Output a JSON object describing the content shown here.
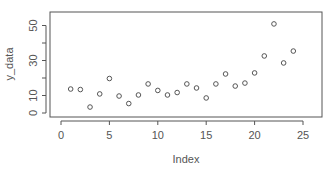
{
  "chart_data": {
    "type": "scatter",
    "title": "",
    "xlabel": "Index",
    "ylabel": "y_data",
    "xlim": [
      -1,
      27
    ],
    "ylim": [
      -2,
      57
    ],
    "x_ticks": [
      0,
      5,
      10,
      15,
      20,
      25
    ],
    "y_ticks": [
      0,
      10,
      20,
      30,
      40,
      50
    ],
    "y_tick_labels": [
      "0",
      "10",
      "",
      "30",
      "",
      "50"
    ],
    "grid": false,
    "legend": null,
    "marker": "open-circle",
    "x": [
      1,
      2,
      3,
      4,
      5,
      6,
      7,
      8,
      9,
      10,
      11,
      12,
      13,
      14,
      15,
      16,
      17,
      18,
      19,
      20,
      21,
      22,
      23,
      24
    ],
    "values": [
      13.7,
      13.4,
      3.4,
      10.9,
      19.7,
      9.7,
      5.4,
      10.3,
      16.6,
      12.9,
      10.3,
      11.7,
      16.6,
      14.3,
      8.6,
      16.6,
      22.3,
      15.4,
      17.1,
      22.9,
      32.6,
      50.9,
      28.6,
      35.4
    ]
  },
  "colors": {
    "frame": "#555555",
    "points": "#555555",
    "text": "#555555",
    "background": "#ffffff"
  }
}
